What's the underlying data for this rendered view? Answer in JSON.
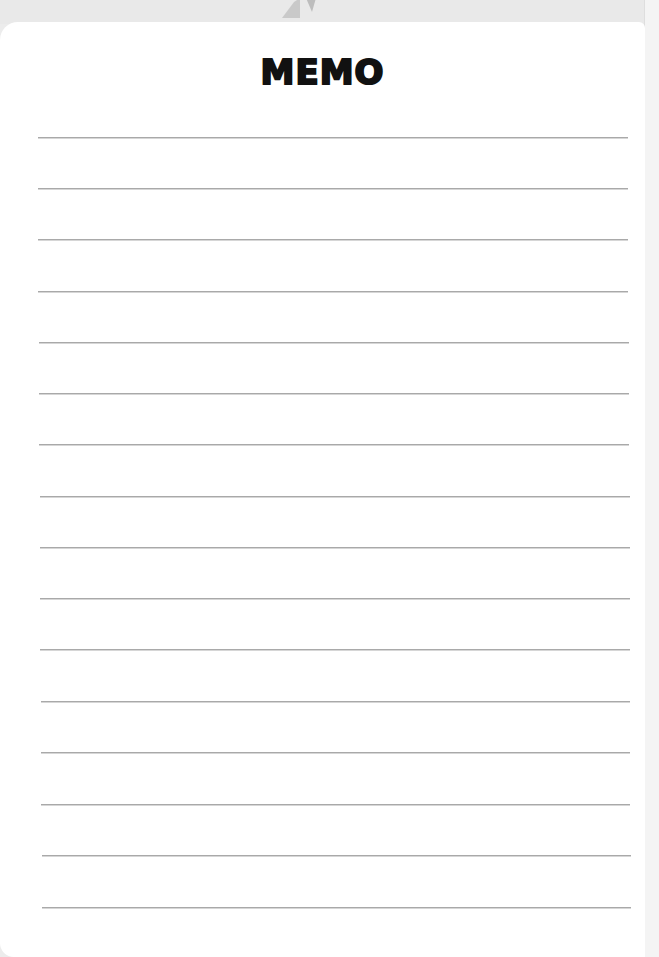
{
  "memo": {
    "title": "MEMO",
    "rule_color": "#a9a9a9",
    "background_color": "#ffffff",
    "header_band_color": "#e9e9e9",
    "lines": [
      {
        "index": 1,
        "y": 137,
        "x1": 38,
        "x2": 628
      },
      {
        "index": 2,
        "y": 188,
        "x1": 38,
        "x2": 628
      },
      {
        "index": 3,
        "y": 239,
        "x1": 38,
        "x2": 628
      },
      {
        "index": 4,
        "y": 291,
        "x1": 38,
        "x2": 628
      },
      {
        "index": 5,
        "y": 342,
        "x1": 39,
        "x2": 629
      },
      {
        "index": 6,
        "y": 393,
        "x1": 39,
        "x2": 629
      },
      {
        "index": 7,
        "y": 444,
        "x1": 39,
        "x2": 629
      },
      {
        "index": 8,
        "y": 496,
        "x1": 40,
        "x2": 630
      },
      {
        "index": 9,
        "y": 547,
        "x1": 40,
        "x2": 630
      },
      {
        "index": 10,
        "y": 598,
        "x1": 40,
        "x2": 630
      },
      {
        "index": 11,
        "y": 649,
        "x1": 40,
        "x2": 630
      },
      {
        "index": 12,
        "y": 701,
        "x1": 41,
        "x2": 630
      },
      {
        "index": 13,
        "y": 752,
        "x1": 41,
        "x2": 630
      },
      {
        "index": 14,
        "y": 804,
        "x1": 41,
        "x2": 630
      },
      {
        "index": 15,
        "y": 855,
        "x1": 42,
        "x2": 631
      },
      {
        "index": 16,
        "y": 907,
        "x1": 42,
        "x2": 631
      }
    ]
  }
}
